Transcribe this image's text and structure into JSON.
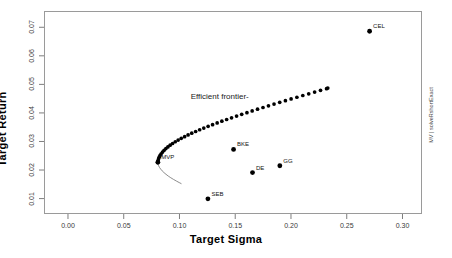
{
  "chart_data": {
    "type": "scatter",
    "title": "",
    "xlabel": "Target Sigma",
    "ylabel": "Target Return",
    "xlim": [
      -0.0215,
      0.3175
    ],
    "ylim": [
      0.0046,
      0.0757
    ],
    "xticks": [
      "0.00",
      "0.05",
      "0.10",
      "0.15",
      "0.20",
      "0.25",
      "0.30"
    ],
    "xtick_values": [
      0.0,
      0.05,
      0.1,
      0.15,
      0.2,
      0.25,
      0.3
    ],
    "yticks": [
      "0.01",
      "0.02",
      "0.03",
      "0.04",
      "0.05",
      "0.06",
      "0.07"
    ],
    "ytick_values": [
      0.01,
      0.02,
      0.03,
      0.04,
      0.05,
      0.06,
      0.07
    ],
    "grid": false,
    "legend": "none",
    "series": [
      {
        "name": "Efficient frontier",
        "type": "scatter",
        "marker": "filled-circle",
        "color": "#000000",
        "points": [
          [
            0.0806,
            0.0227
          ],
          [
            0.0808,
            0.0233
          ],
          [
            0.0812,
            0.0239
          ],
          [
            0.0818,
            0.0245
          ],
          [
            0.0826,
            0.0251
          ],
          [
            0.0836,
            0.0257
          ],
          [
            0.0848,
            0.0263
          ],
          [
            0.0862,
            0.0269
          ],
          [
            0.0878,
            0.0275
          ],
          [
            0.0896,
            0.0281
          ],
          [
            0.0916,
            0.0287
          ],
          [
            0.0938,
            0.0293
          ],
          [
            0.0962,
            0.0299
          ],
          [
            0.0988,
            0.0305
          ],
          [
            0.1016,
            0.0311
          ],
          [
            0.1046,
            0.0317
          ],
          [
            0.1077,
            0.0323
          ],
          [
            0.111,
            0.0329
          ],
          [
            0.1145,
            0.0335
          ],
          [
            0.1181,
            0.0341
          ],
          [
            0.1218,
            0.0347
          ],
          [
            0.1257,
            0.0353
          ],
          [
            0.1297,
            0.0359
          ],
          [
            0.1338,
            0.0365
          ],
          [
            0.138,
            0.0371
          ],
          [
            0.1423,
            0.0377
          ],
          [
            0.1467,
            0.0383
          ],
          [
            0.1512,
            0.0389
          ],
          [
            0.1558,
            0.0395
          ],
          [
            0.1605,
            0.0401
          ],
          [
            0.1652,
            0.0407
          ],
          [
            0.17,
            0.0413
          ],
          [
            0.1749,
            0.0419
          ],
          [
            0.1798,
            0.0425
          ],
          [
            0.1848,
            0.0431
          ],
          [
            0.1899,
            0.0437
          ],
          [
            0.195,
            0.0443
          ],
          [
            0.2001,
            0.0449
          ],
          [
            0.2053,
            0.0455
          ],
          [
            0.2106,
            0.0461
          ],
          [
            0.2159,
            0.0467
          ],
          [
            0.2212,
            0.0473
          ],
          [
            0.2265,
            0.0479
          ],
          [
            0.2319,
            0.0485
          ],
          [
            0.233,
            0.0487
          ]
        ]
      },
      {
        "name": "Inefficient branch",
        "type": "line",
        "color": "#6f6f6f",
        "points": [
          [
            0.0806,
            0.0227
          ],
          [
            0.0808,
            0.0221
          ],
          [
            0.0813,
            0.0215
          ],
          [
            0.0821,
            0.0209
          ],
          [
            0.0832,
            0.0203
          ],
          [
            0.0845,
            0.0197
          ],
          [
            0.0861,
            0.0191
          ],
          [
            0.0879,
            0.0185
          ],
          [
            0.0899,
            0.0179
          ],
          [
            0.0922,
            0.0173
          ],
          [
            0.0947,
            0.0167
          ],
          [
            0.0974,
            0.0161
          ],
          [
            0.1003,
            0.0155
          ],
          [
            0.1018,
            0.0152
          ]
        ]
      },
      {
        "name": "Assets",
        "type": "scatter",
        "marker": "filled-circle",
        "color": "#000000",
        "points": [
          {
            "label": "CEL",
            "x": 0.2705,
            "y": 0.0686
          },
          {
            "label": "BKE",
            "x": 0.1485,
            "y": 0.0272
          },
          {
            "label": "GG",
            "x": 0.19,
            "y": 0.0215
          },
          {
            "label": "DE",
            "x": 0.1655,
            "y": 0.0191
          },
          {
            "label": "SEB",
            "x": 0.1255,
            "y": 0.0099
          }
        ]
      },
      {
        "name": "Minimum variance portfolio",
        "type": "scatter",
        "marker": "filled-circle",
        "color": "#000000",
        "points": [
          {
            "label": "MVP",
            "x": 0.0806,
            "y": 0.0227
          }
        ]
      }
    ],
    "annotations": [
      {
        "text": "Efficient frontier-",
        "x": 0.11,
        "y": 0.0452
      }
    ]
  },
  "axis": {
    "x_title": "Target Sigma",
    "y_title": "Target Return"
  },
  "footer": {
    "side_note": "MV | solveRshortExact"
  }
}
